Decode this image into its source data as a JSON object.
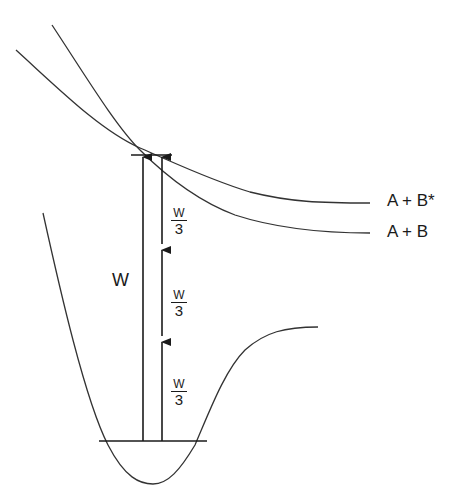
{
  "diagram": {
    "type": "potential-energy-curve-multiphoton-excitation",
    "curves": {
      "ground_state_well": {
        "label": ""
      },
      "repulsive_upper": {
        "label": "A + B*"
      },
      "repulsive_lower": {
        "label": "A + B"
      }
    },
    "labels": {
      "state_excited": "A + B*",
      "state_ground_products": "A + B",
      "single_photon": "W",
      "fraction_1": {
        "numerator": "W",
        "denominator": "3"
      },
      "fraction_2": {
        "numerator": "W",
        "denominator": "3"
      },
      "fraction_3": {
        "numerator": "W",
        "denominator": "3"
      }
    },
    "arrows": [
      {
        "name": "single-photon-arrow",
        "from_y": 441,
        "to_y": 155,
        "label": "W"
      },
      {
        "name": "photon-step-1",
        "from_y": 441,
        "to_y": 340,
        "label": "W/3"
      },
      {
        "name": "photon-step-2",
        "from_y": 340,
        "to_y": 248,
        "label": "W/3"
      },
      {
        "name": "photon-step-3",
        "from_y": 248,
        "to_y": 155,
        "label": "W/3"
      }
    ],
    "colors": {
      "stroke": "#1a1a1a",
      "background": "#ffffff"
    }
  }
}
